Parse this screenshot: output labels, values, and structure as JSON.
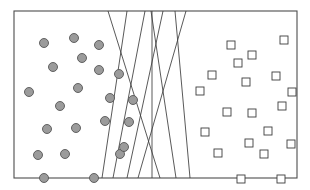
{
  "figure": {
    "title": "Two point clusters separated by a band of crossing lines",
    "width": 310,
    "height": 190,
    "background_color": "#ffffff"
  },
  "frame": {
    "name": "outer-rectangle",
    "x": 14,
    "y": 11,
    "width": 283,
    "height": 167,
    "stroke_color": "#4d4d4d",
    "fill_color": "#ffffff",
    "stroke_width": 1.1
  },
  "chart_data": {
    "type": "scatter",
    "title": "Two point clusters separated by a band of crossing lines",
    "xlabel": "",
    "ylabel": "",
    "xlim": [
      14,
      297
    ],
    "ylim": [
      11,
      178
    ],
    "grid": false,
    "legend": "none",
    "series": [
      {
        "name": "circles",
        "marker": "circle",
        "fill_color": "#9b9b9b",
        "stroke_color": "#565656",
        "marker_size": 9,
        "count": 22,
        "points": [
          [
            44,
            43
          ],
          [
            74,
            38
          ],
          [
            99,
            45
          ],
          [
            53,
            67
          ],
          [
            82,
            58
          ],
          [
            119,
            74
          ],
          [
            29,
            92
          ],
          [
            78,
            88
          ],
          [
            110,
            98
          ],
          [
            60,
            106
          ],
          [
            133,
            100
          ],
          [
            105,
            121
          ],
          [
            129,
            122
          ],
          [
            47,
            129
          ],
          [
            76,
            128
          ],
          [
            65,
            154
          ],
          [
            120,
            154
          ],
          [
            44,
            178
          ],
          [
            94,
            178
          ],
          [
            99,
            70
          ],
          [
            124,
            147
          ],
          [
            38,
            155
          ]
        ]
      },
      {
        "name": "squares",
        "marker": "square",
        "fill_color": "#ffffff",
        "stroke_color": "#3d3d3d",
        "marker_size": 8,
        "count": 20,
        "points": [
          [
            231,
            45
          ],
          [
            284,
            40
          ],
          [
            252,
            55
          ],
          [
            212,
            75
          ],
          [
            246,
            82
          ],
          [
            276,
            76
          ],
          [
            200,
            91
          ],
          [
            227,
            112
          ],
          [
            252,
            113
          ],
          [
            282,
            106
          ],
          [
            268,
            131
          ],
          [
            249,
            143
          ],
          [
            291,
            144
          ],
          [
            218,
            153
          ],
          [
            264,
            154
          ],
          [
            241,
            179
          ],
          [
            281,
            179
          ],
          [
            205,
            132
          ],
          [
            238,
            63
          ],
          [
            292,
            92
          ]
        ]
      }
    ],
    "lines": {
      "name": "crossing-separator-lines",
      "count": 7,
      "stroke_color": "#3b3b3b",
      "stroke_width": 0.85,
      "segments": [
        {
          "x1": 108,
          "y1": 11,
          "x2": 160,
          "y2": 178
        },
        {
          "x1": 127,
          "y1": 11,
          "x2": 102,
          "y2": 178
        },
        {
          "x1": 145,
          "y1": 11,
          "x2": 113,
          "y2": 178
        },
        {
          "x1": 163,
          "y1": 11,
          "x2": 127,
          "y2": 178
        },
        {
          "x1": 151,
          "y1": 11,
          "x2": 176,
          "y2": 178
        },
        {
          "x1": 186,
          "y1": 11,
          "x2": 138,
          "y2": 178
        },
        {
          "x1": 175,
          "y1": 11,
          "x2": 190,
          "y2": 178
        },
        {
          "x1": 152,
          "y1": 11,
          "x2": 152,
          "y2": 178
        }
      ]
    }
  }
}
